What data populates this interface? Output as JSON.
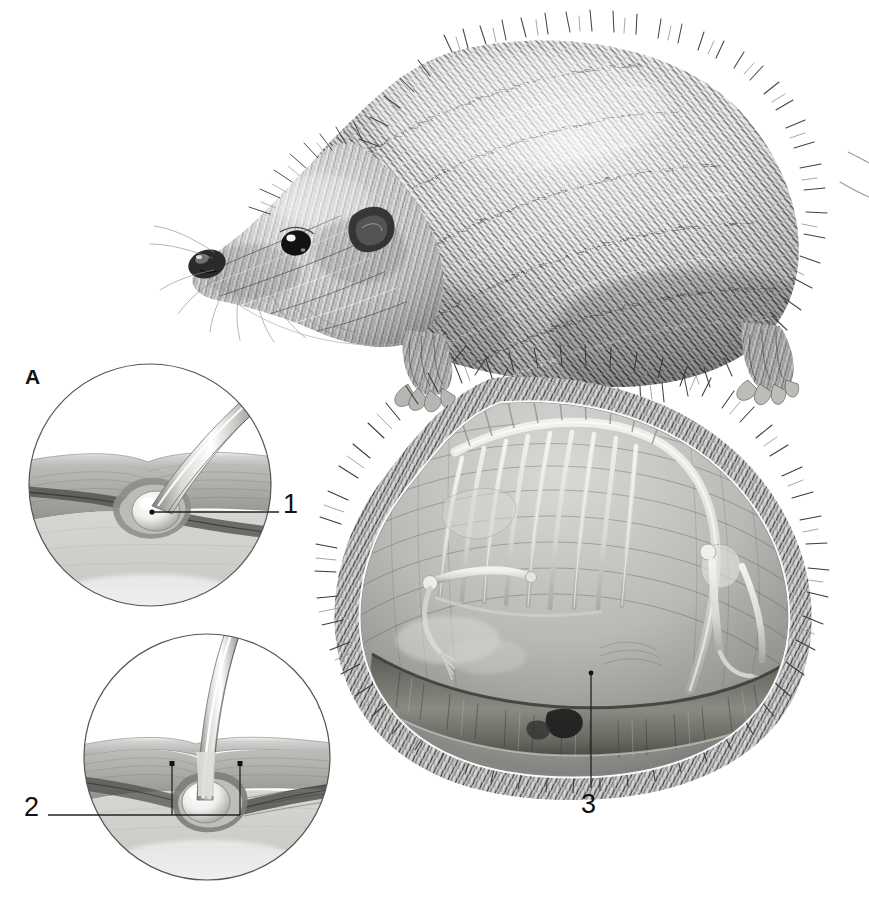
{
  "figure": {
    "style": "graphite anatomical illustration",
    "background_color": "#ffffff",
    "ink_color": "#1a1a1a",
    "width": 869,
    "height": 897
  },
  "panel_labels": [
    {
      "id": "A",
      "text": "A",
      "x": 32,
      "y": 377
    }
  ],
  "callouts": [
    {
      "id": "1",
      "text": "1",
      "label_x": 288,
      "label_y": 505,
      "leader": {
        "x1": 152,
        "y1": 512,
        "x2": 279,
        "y2": 512
      },
      "dot": {
        "cx": 152,
        "cy": 512,
        "r": 2.6
      }
    },
    {
      "id": "2",
      "text": "2",
      "label_x": 25,
      "label_y": 808,
      "leader": {
        "x1": 48,
        "y1": 815,
        "x2": 172,
        "y2": 815
      },
      "bracket": {
        "x1": 172,
        "y1": 815,
        "x2": 240,
        "y2": 815,
        "top_y": 764
      }
    },
    {
      "id": "3",
      "text": "3",
      "label_x": 580,
      "label_y": 804,
      "leader": {
        "x1": 591,
        "y1": 673,
        "x2": 591,
        "y2": 788
      },
      "dot": {
        "cx": 591,
        "cy": 673,
        "r": 2.4
      }
    }
  ],
  "insets": [
    {
      "name": "inset-skin-oblique-spine",
      "panel": "A",
      "circle": {
        "cx": 150,
        "cy": 485,
        "r": 122
      },
      "shows": "skin cross-section with obliquely inserted spine and bulbous root"
    },
    {
      "name": "inset-skin-erect-spine",
      "panel": "",
      "circle": {
        "cx": 207,
        "cy": 757,
        "r": 124
      },
      "shows": "skin cross-section with erect spine, follicle bulb and muscle bracket"
    }
  ],
  "main_illustration": {
    "name": "hedgehog-whole-body",
    "description": "hedgehog in left profile, walking, covered in spines"
  },
  "cutaway_illustration": {
    "name": "hedgehog-cutaway-rolled",
    "description": "cutaway of rolled hedgehog showing skeleton inside the spiny mantle and the panniculus carnosus muscle band"
  },
  "palette": {
    "spine_dark": "#3b3b3b",
    "spine_mid": "#7a7a7a",
    "spine_light": "#c8c8c8",
    "skin_dermis": "#b4b4b4",
    "skin_subcutis": "#cdcdcd",
    "muscle_band": "#6e6e6e",
    "bone": "#e8e8e6",
    "circle_stroke": "#555555",
    "leader_stroke": "#222222"
  }
}
